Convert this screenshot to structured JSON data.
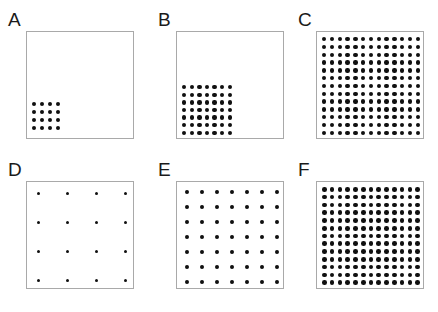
{
  "figure": {
    "background_color": "#ffffff",
    "box_border_color": "#a9a9a9",
    "dot_color": "#101010",
    "rows": 2,
    "columns": 3
  },
  "panels": [
    {
      "label": "A",
      "name": "panel-a",
      "cols": 4,
      "rows": 4,
      "dot_count": 16,
      "dot_radius": 2.0,
      "spacing": 7.2,
      "placement": "bottom-left-cluster",
      "region": {
        "x": 5,
        "y": 70,
        "width": 28,
        "height": 28
      },
      "origin": {
        "x": 8,
        "y": 149
      }
    },
    {
      "label": "B",
      "name": "panel-b",
      "cols": 7,
      "rows": 7,
      "dot_count": 49,
      "dot_radius": 2.2,
      "spacing": 7.6,
      "placement": "bottom-left-cluster",
      "region": {
        "x": 5,
        "y": 53,
        "width": 50,
        "height": 50
      },
      "origin": {
        "x": 158,
        "y": 149
      }
    },
    {
      "label": "C",
      "name": "panel-c",
      "cols": 13,
      "rows": 13,
      "dot_count": 169,
      "dot_radius": 2.2,
      "spacing": 8.1,
      "placement": "full-box",
      "region": {
        "x": 5,
        "y": 5,
        "width": 98,
        "height": 98
      },
      "origin": {
        "x": 298,
        "y": 149
      }
    },
    {
      "label": "D",
      "name": "panel-d",
      "cols": 4,
      "rows": 4,
      "dot_count": 16,
      "dot_radius": 1.7,
      "spacing": 30.0,
      "placement": "full-box",
      "region": {
        "x": 10,
        "y": 10,
        "width": 90,
        "height": 90
      },
      "origin": {
        "x": 8,
        "y": 298
      }
    },
    {
      "label": "E",
      "name": "panel-e",
      "cols": 7,
      "rows": 7,
      "dot_count": 49,
      "dot_radius": 1.9,
      "spacing": 15.6,
      "placement": "full-box",
      "region": {
        "x": 8,
        "y": 8,
        "width": 94,
        "height": 94
      },
      "origin": {
        "x": 158,
        "y": 298
      }
    },
    {
      "label": "F",
      "name": "panel-f",
      "cols": 13,
      "rows": 13,
      "dot_count": 169,
      "dot_radius": 2.3,
      "spacing": 8.1,
      "placement": "full-box",
      "region": {
        "x": 5,
        "y": 5,
        "width": 98,
        "height": 98
      },
      "origin": {
        "x": 298,
        "y": 149
      }
    }
  ],
  "panel_positions": [
    {
      "left": 8,
      "top": 10
    },
    {
      "left": 158,
      "top": 10
    },
    {
      "left": 298,
      "top": 10
    },
    {
      "left": 8,
      "top": 160
    },
    {
      "left": 158,
      "top": 160
    },
    {
      "left": 298,
      "top": 160
    }
  ]
}
